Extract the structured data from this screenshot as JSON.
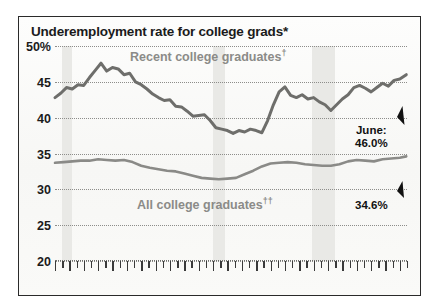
{
  "figure": {
    "title": "Underemployment rate for college grads*",
    "title_footnote": "*"
  },
  "chart_data": {
    "type": "line",
    "title": "Underemployment rate for college grads*",
    "xlabel": "",
    "ylabel": "",
    "ylim": [
      20,
      50
    ],
    "xlim": [
      1990,
      2014.5
    ],
    "grid": true,
    "legend": "inline-labels",
    "ytick_labels": [
      "50%",
      "45",
      "40",
      "35",
      "30",
      "25",
      "20"
    ],
    "ytick_values": [
      50,
      45,
      40,
      35,
      30,
      25,
      20
    ],
    "xtick_labels": [
      "1990",
      "'95",
      "'00",
      "'05",
      "'10",
      "'14"
    ],
    "xtick_values": [
      1990,
      1995,
      2000,
      2005,
      2010,
      2014
    ],
    "shaded_regions": [
      {
        "name": "recession-1990",
        "start": 1990.5,
        "end": 1991.2
      },
      {
        "name": "recession-2001",
        "start": 2001.0,
        "end": 2001.8
      },
      {
        "name": "recession-2008",
        "start": 2007.9,
        "end": 2009.5
      }
    ],
    "series": [
      {
        "name": "Recent college graduates†",
        "label": "Recent college graduates",
        "label_footnote": "†",
        "color": "#6e6e6b",
        "x": [
          1990.0,
          1990.4,
          1990.8,
          1991.2,
          1991.6,
          1992.0,
          1992.4,
          1992.8,
          1993.2,
          1993.6,
          1994.0,
          1994.4,
          1994.8,
          1995.2,
          1995.6,
          1996.0,
          1996.4,
          1996.8,
          1997.2,
          1997.6,
          1998.0,
          1998.4,
          1998.8,
          1999.2,
          1999.6,
          2000.0,
          2000.4,
          2000.8,
          2001.2,
          2001.6,
          2002.0,
          2002.4,
          2002.8,
          2003.2,
          2003.6,
          2004.0,
          2004.4,
          2004.8,
          2005.2,
          2005.6,
          2006.0,
          2006.4,
          2006.8,
          2007.2,
          2007.6,
          2008.0,
          2008.4,
          2008.8,
          2009.2,
          2009.6,
          2010.0,
          2010.4,
          2010.8,
          2011.2,
          2011.6,
          2012.0,
          2012.4,
          2012.8,
          2013.2,
          2013.6,
          2014.0,
          2014.45
        ],
        "values": [
          42.8,
          43.4,
          44.2,
          44.0,
          44.6,
          44.5,
          45.6,
          46.6,
          47.6,
          46.5,
          47.0,
          46.8,
          46.0,
          46.2,
          45.0,
          44.6,
          44.0,
          43.3,
          42.8,
          42.4,
          42.5,
          41.6,
          41.5,
          40.9,
          40.2,
          40.3,
          40.4,
          39.6,
          38.6,
          38.4,
          38.2,
          37.8,
          38.2,
          38.0,
          38.4,
          38.2,
          37.9,
          39.6,
          41.8,
          43.6,
          44.3,
          43.1,
          42.8,
          43.2,
          42.6,
          42.8,
          42.2,
          41.8,
          41.0,
          41.8,
          42.6,
          43.2,
          44.2,
          44.5,
          44.1,
          43.6,
          44.2,
          44.8,
          44.4,
          45.2,
          45.4,
          46.0
        ],
        "end_value": 46.0
      },
      {
        "name": "All college graduates††",
        "label": "All college graduates",
        "label_footnote": "††",
        "color": "#8a8a87",
        "x": [
          1990.0,
          1990.6,
          1991.2,
          1991.8,
          1992.4,
          1993.0,
          1993.6,
          1994.2,
          1994.8,
          1995.4,
          1996.0,
          1996.6,
          1997.2,
          1997.8,
          1998.4,
          1999.0,
          1999.6,
          2000.2,
          2000.8,
          2001.4,
          2002.0,
          2002.6,
          2003.2,
          2003.8,
          2004.4,
          2005.0,
          2005.6,
          2006.2,
          2006.8,
          2007.4,
          2008.0,
          2008.6,
          2009.2,
          2009.8,
          2010.4,
          2011.0,
          2011.6,
          2012.2,
          2012.8,
          2013.4,
          2014.0,
          2014.45
        ],
        "values": [
          33.7,
          33.8,
          33.9,
          34.0,
          34.0,
          34.2,
          34.1,
          34.0,
          34.1,
          33.8,
          33.3,
          33.0,
          32.8,
          32.6,
          32.5,
          32.2,
          31.9,
          31.6,
          31.5,
          31.4,
          31.5,
          31.6,
          32.1,
          32.6,
          33.2,
          33.6,
          33.7,
          33.8,
          33.7,
          33.5,
          33.4,
          33.3,
          33.3,
          33.5,
          33.9,
          34.1,
          34.0,
          33.9,
          34.2,
          34.3,
          34.4,
          34.6
        ],
        "end_value": 34.6
      }
    ],
    "annotations": [
      {
        "name": "recent-grads-callout",
        "lines": [
          "June:",
          "46.0%"
        ],
        "value": 46.0,
        "month": "June"
      },
      {
        "name": "all-grads-callout",
        "lines": [
          "34.6%"
        ],
        "value": 34.6
      }
    ]
  }
}
